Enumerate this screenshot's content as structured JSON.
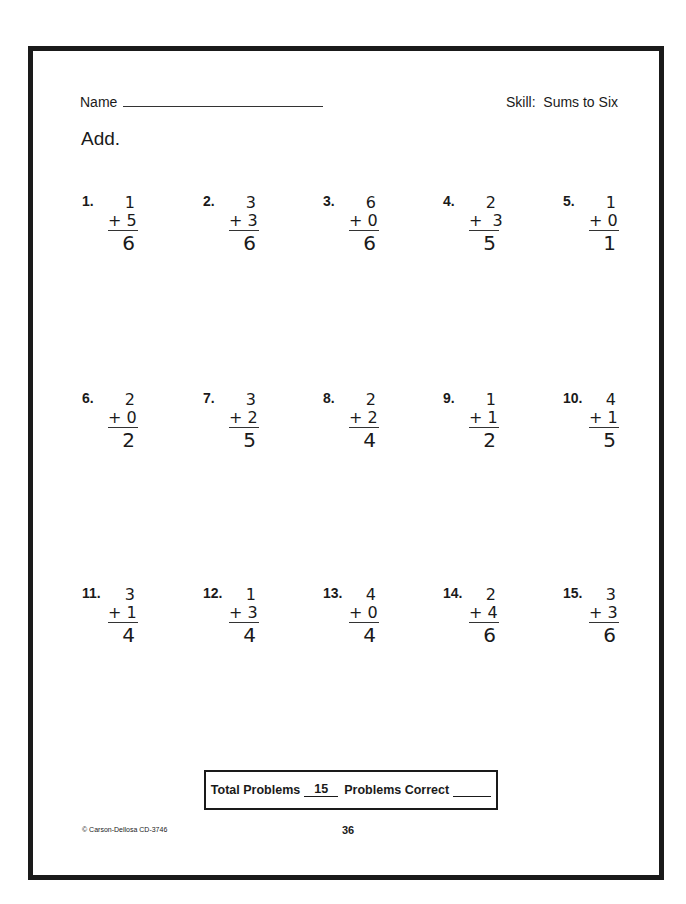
{
  "header": {
    "name_label": "Name",
    "skill_label": "Skill:  Sums to Six"
  },
  "instructions": "Add.",
  "problems": [
    {
      "number": "1.",
      "top": "1",
      "bottom": "+ 5",
      "sum": "6"
    },
    {
      "number": "2.",
      "top": "3",
      "bottom": "+ 3",
      "sum": "6"
    },
    {
      "number": "3.",
      "top": "6",
      "bottom": "+ 0",
      "sum": "6"
    },
    {
      "number": "4.",
      "top": "2",
      "bottom": "+  3",
      "sum": "5"
    },
    {
      "number": "5.",
      "top": "1",
      "bottom": "+ 0",
      "sum": "1"
    },
    {
      "number": "6.",
      "top": "2",
      "bottom": "+ 0",
      "sum": "2"
    },
    {
      "number": "7.",
      "top": "3",
      "bottom": "+ 2",
      "sum": "5"
    },
    {
      "number": "8.",
      "top": "2",
      "bottom": "+ 2",
      "sum": "4"
    },
    {
      "number": "9.",
      "top": "1",
      "bottom": "+ 1",
      "sum": "2"
    },
    {
      "number": "10.",
      "top": "4",
      "bottom": "+ 1",
      "sum": "5"
    },
    {
      "number": "11.",
      "top": "3",
      "bottom": "+ 1",
      "sum": "4"
    },
    {
      "number": "12.",
      "top": "1",
      "bottom": "+ 3",
      "sum": "4"
    },
    {
      "number": "13.",
      "top": "4",
      "bottom": "+ 0",
      "sum": "4"
    },
    {
      "number": "14.",
      "top": "2",
      "bottom": "+ 4",
      "sum": "6"
    },
    {
      "number": "15.",
      "top": "3",
      "bottom": "+ 3",
      "sum": "6"
    }
  ],
  "score_box": {
    "total_label": "Total Problems",
    "total_value": "15",
    "correct_label": "Problems Correct"
  },
  "footer": {
    "copyright": "© Carson-Dellosa CD-3746",
    "page_number": "36"
  }
}
